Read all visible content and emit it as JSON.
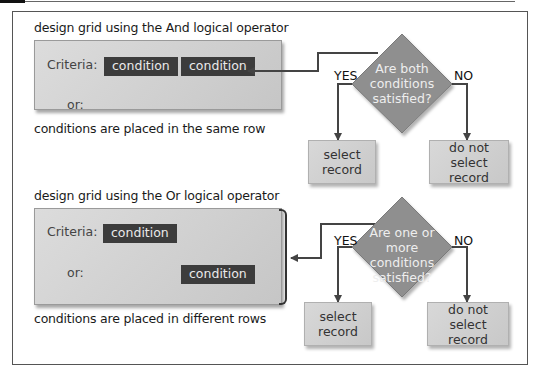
{
  "and_section": {
    "title": "design grid using the And logical operator",
    "criteria_label": "Criteria:",
    "or_label": "or:",
    "conditions": [
      "condition",
      "condition"
    ],
    "footnote": "conditions are placed in the same row",
    "decision": "Are both conditions satisfied?",
    "decision_lines": [
      "Are both",
      "conditions",
      "satisfied?"
    ],
    "yes_label": "YES",
    "no_label": "NO",
    "yes_result": [
      "select",
      "record"
    ],
    "no_result": [
      "do not",
      "select record"
    ]
  },
  "or_section": {
    "title": "design grid using the Or logical operator",
    "criteria_label": "Criteria:",
    "or_label": "or:",
    "conditions": [
      "condition",
      "condition"
    ],
    "footnote": "conditions are placed in different rows",
    "decision": "Are one or more conditions satisfied?",
    "decision_lines": [
      "Are one or",
      "more conditions",
      "satisfied?"
    ],
    "yes_label": "YES",
    "no_label": "NO",
    "yes_result": [
      "select",
      "record"
    ],
    "no_result": [
      "do not",
      "select record"
    ]
  },
  "colors": {
    "condition_fill": "#3c3c3c",
    "diamond_fill": "#8f8f8f",
    "grid_fill": "#d4d4d4",
    "connector": "#444444"
  }
}
